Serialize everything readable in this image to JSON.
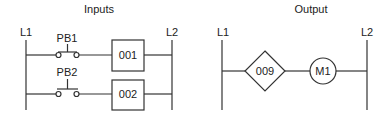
{
  "inputs": {
    "title": "Inputs",
    "rail_left": "L1",
    "rail_right": "L2",
    "rungs": [
      {
        "contact_label": "PB1",
        "contact_type": "normally-closed pushbutton",
        "block_label": "001"
      },
      {
        "contact_label": "PB2",
        "contact_type": "normally-open pushbutton",
        "block_label": "002"
      }
    ]
  },
  "output": {
    "title": "Output",
    "rail_left": "L1",
    "rail_right": "L2",
    "rung": {
      "diamond_label": "009",
      "coil_label": "M1"
    }
  },
  "colors": {
    "line": "#333333",
    "background": "#ffffff"
  }
}
